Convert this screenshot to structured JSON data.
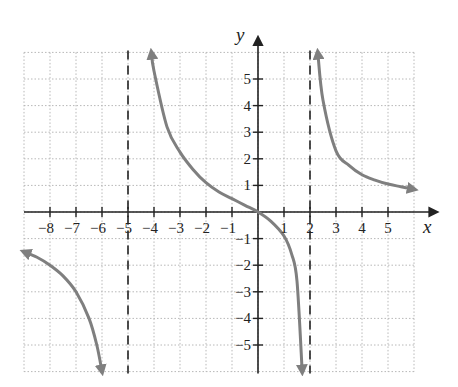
{
  "chart_data": {
    "type": "line",
    "title": "",
    "xlabel": "x",
    "ylabel": "y",
    "xlim": [
      -9,
      6
    ],
    "ylim": [
      -6,
      6
    ],
    "grid": true,
    "x_ticks": [
      -8,
      -7,
      -6,
      -5,
      -4,
      -3,
      -2,
      -1,
      1,
      2,
      3,
      4,
      5
    ],
    "x_tick_labels": [
      "−8",
      "−7",
      "−6",
      "−5",
      "−4",
      "−3",
      "−2",
      "−1",
      "1",
      "2",
      "3",
      "4",
      "5"
    ],
    "y_ticks": [
      5,
      4,
      3,
      2,
      1,
      -1,
      -2,
      -3,
      -4,
      -5
    ],
    "y_tick_labels": [
      "5",
      "4",
      "3",
      "2",
      "1",
      "−1",
      "−2",
      "−3",
      "−4",
      "−5"
    ],
    "vertical_asymptotes": [
      -5,
      2
    ],
    "function_description": "Rational function with vertical asymptotes at x = -5 and x = 2, passing through the origin, horizontal asymptote y = 0",
    "series": [
      {
        "name": "left branch",
        "x": [
          -9.0,
          -8.5,
          -8.0,
          -7.5,
          -7.0,
          -6.5,
          -6.2,
          -6.0
        ],
        "y": [
          -1.5,
          -1.7,
          -2.0,
          -2.4,
          -3.0,
          -4.0,
          -5.0,
          -6.0
        ]
      },
      {
        "name": "middle branch",
        "x": [
          -4.1,
          -4.0,
          -3.5,
          -3.0,
          -2.5,
          -2.0,
          -1.5,
          -1.0,
          -0.5,
          0.0,
          0.5,
          1.0,
          1.3,
          1.5,
          1.7
        ],
        "y": [
          6.0,
          5.3,
          3.2,
          2.25,
          1.6,
          1.1,
          0.75,
          0.5,
          0.25,
          0.0,
          -0.35,
          -0.9,
          -1.6,
          -2.6,
          -6.0
        ]
      },
      {
        "name": "right branch",
        "x": [
          2.3,
          2.5,
          3.0,
          3.5,
          4.0,
          4.5,
          5.0,
          5.5,
          6.0
        ],
        "y": [
          6.0,
          4.2,
          2.3,
          1.75,
          1.4,
          1.2,
          1.05,
          0.95,
          0.85
        ]
      }
    ]
  }
}
